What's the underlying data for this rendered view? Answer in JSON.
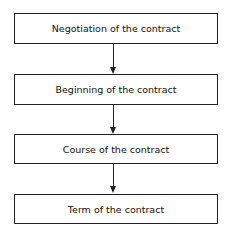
{
  "diagram": {
    "type": "flowchart",
    "nodes": [
      {
        "label": "Negotiation of the contract"
      },
      {
        "label": "Beginning of the contract"
      },
      {
        "label": "Course of the contract"
      },
      {
        "label": "Term of the contract"
      }
    ],
    "edges": [
      {
        "from": 0,
        "to": 1
      },
      {
        "from": 1,
        "to": 2
      },
      {
        "from": 2,
        "to": 3
      }
    ]
  }
}
